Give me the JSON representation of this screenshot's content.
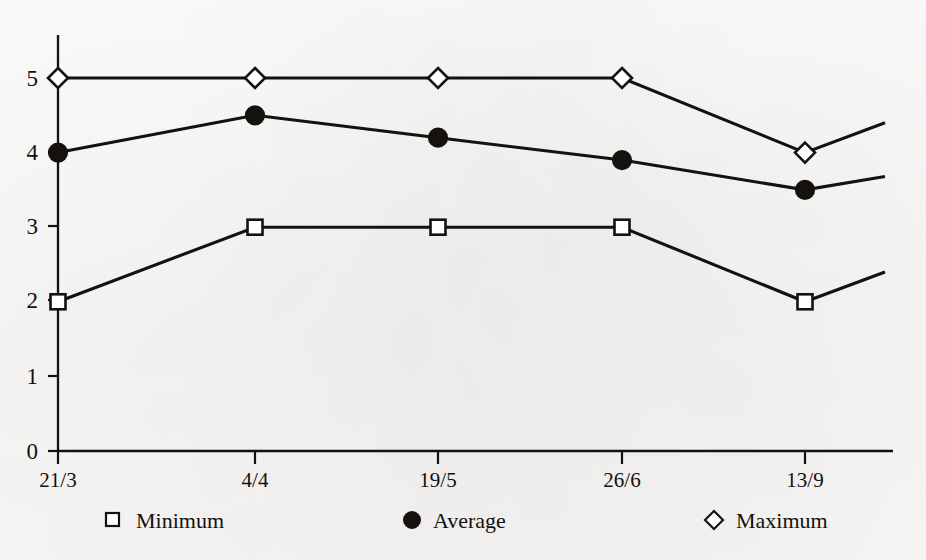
{
  "chart_data": {
    "type": "line",
    "title": "",
    "xlabel": "",
    "ylabel": "",
    "categories": [
      "21/3",
      "4/4",
      "19/5",
      "26/6",
      "13/9"
    ],
    "yticks": [
      0,
      1,
      2,
      3,
      4,
      5
    ],
    "ylim": [
      0,
      5.5
    ],
    "grid": false,
    "legend_position": "bottom",
    "series": [
      {
        "name": "Minimum",
        "marker": "open-square",
        "values": [
          2,
          3,
          3,
          3,
          2
        ]
      },
      {
        "name": "Average",
        "marker": "filled-circle",
        "values": [
          4,
          4.5,
          4.2,
          3.9,
          3.5
        ]
      },
      {
        "name": "Maximum",
        "marker": "open-diamond",
        "values": [
          5,
          5,
          5,
          5,
          4
        ]
      }
    ],
    "trailing_segment": {
      "note": "each series continues past the last category and rises to the right plot edge",
      "values": {
        "Minimum": 2.4,
        "Average": 3.68,
        "Maximum": 4.4
      }
    }
  },
  "axis": {
    "ytick_labels": [
      "5",
      "4",
      "3",
      "2",
      "1",
      "0"
    ],
    "xtick_labels": [
      "21/3",
      "4/4",
      "19/5",
      "26/6",
      "13/9"
    ]
  },
  "legend": {
    "items": [
      {
        "label": "Minimum",
        "icon": "open-square-marker-icon"
      },
      {
        "label": "Average",
        "icon": "filled-circle-marker-icon"
      },
      {
        "label": "Maximum",
        "icon": "open-diamond-marker-icon"
      }
    ]
  },
  "colors": {
    "ink": "#15110f",
    "paper": "#fefefd",
    "marker_fill": "#ffffff"
  }
}
